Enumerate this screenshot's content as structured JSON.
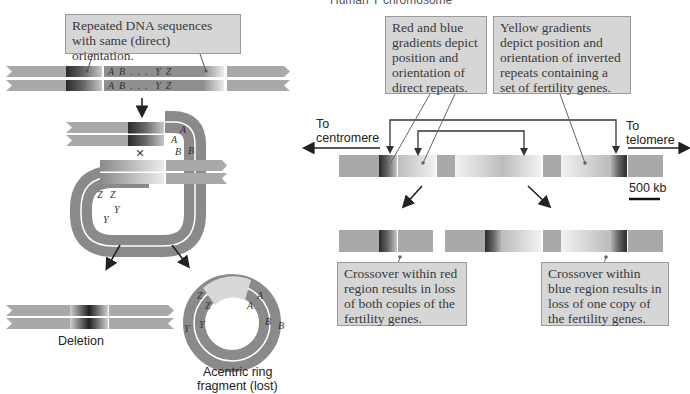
{
  "header": {
    "partial_title": "Human Y chromosome"
  },
  "left_panel": {
    "callout_top": "Repeated DNA sequences with same (direct) orientation.",
    "sequence_letters_top": [
      "A",
      "B",
      ".",
      ".",
      ".",
      "Y",
      "Z"
    ],
    "crossover_mark": "×",
    "loop_letters": [
      "A",
      "A",
      "B",
      "B",
      "Z",
      "Z",
      "Y",
      "Y"
    ],
    "deletion_label": "Deletion",
    "ring_label_line1": "Acentric ring",
    "ring_label_line2": "fragment (lost)",
    "ring_letters": [
      "Z",
      "Z",
      "A",
      "A",
      "Y",
      "Y",
      "B",
      "B"
    ]
  },
  "right_panel": {
    "callout_direct": "Red and blue gradients depict position and orientation of direct repeats.",
    "callout_inverted": "Yellow gradients depict position and orientation of inverted repeats containing a set of fertility genes.",
    "to_centromere_line1": "To",
    "to_centromere_line2": "centromere",
    "to_telomere_line1": "To",
    "to_telomere_line2": "telomere",
    "scale_label": "500 kb",
    "callout_red": "Crossover within red region results in loss of both copies of the fertility genes.",
    "callout_blue": "Crossover within blue region results in loss of one copy of the fertility genes."
  },
  "colors": {
    "chromatid_gray": "#a9a9a9",
    "loop_dark": "#8a8a8a",
    "callout_bg": "#d6d6d6",
    "arrow": "#222222"
  }
}
